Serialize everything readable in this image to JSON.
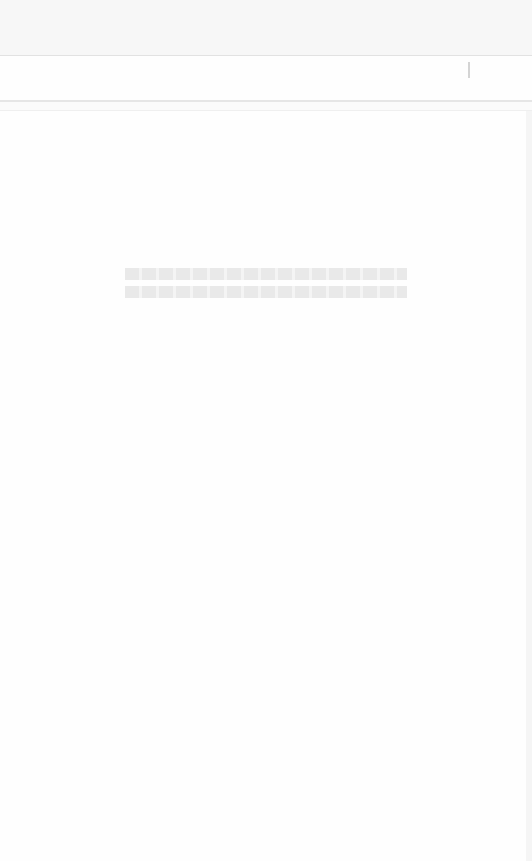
{
  "header": {
    "title": ""
  },
  "toolbar": {
    "icon": "cursor-bar-icon"
  },
  "main": {
    "message_lines": [
      "",
      ""
    ]
  },
  "colors": {
    "background": "#fdfdfd",
    "header_bg": "#f7f7f7",
    "divider": "#e2e2e2",
    "message_text": "#e9e9e9"
  }
}
